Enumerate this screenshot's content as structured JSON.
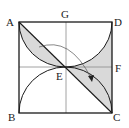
{
  "diagram": {
    "type": "geometry",
    "labels": {
      "A": "A",
      "B": "B",
      "C": "C",
      "D": "D",
      "E": "E",
      "F": "F",
      "G": "G"
    },
    "colors": {
      "stroke": "#1a1a1a",
      "grid_line": "#8a8a8a",
      "shade": "#d9d9d9",
      "background": "#ffffff"
    }
  }
}
